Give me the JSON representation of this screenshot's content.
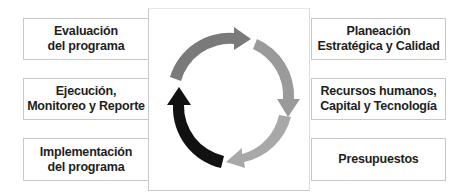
{
  "diagram": {
    "type": "cycle",
    "left_boxes": [
      {
        "id": "evaluacion",
        "lines": [
          "Evaluación",
          "del programa"
        ]
      },
      {
        "id": "ejecucion",
        "lines": [
          "Ejecución,",
          "Monitoreo y Reporte"
        ]
      },
      {
        "id": "implementacion",
        "lines": [
          "Implementación",
          "del programa"
        ]
      }
    ],
    "right_boxes": [
      {
        "id": "planeacion",
        "lines": [
          "Planeación",
          "Estratégica y Calidad"
        ]
      },
      {
        "id": "recursos",
        "lines": [
          "Recursos humanos,",
          "Capital y Tecnología"
        ]
      },
      {
        "id": "presupuestos",
        "lines": [
          "Presupuestos"
        ]
      }
    ],
    "cycle_arrows": [
      {
        "position": "top",
        "direction": "clockwise",
        "color": "#7a7a7a"
      },
      {
        "position": "right",
        "direction": "clockwise",
        "color": "#9a9a9a"
      },
      {
        "position": "bottom",
        "direction": "clockwise",
        "color": "#a8a8a8"
      },
      {
        "position": "left",
        "direction": "clockwise",
        "color": "#111111"
      }
    ]
  }
}
